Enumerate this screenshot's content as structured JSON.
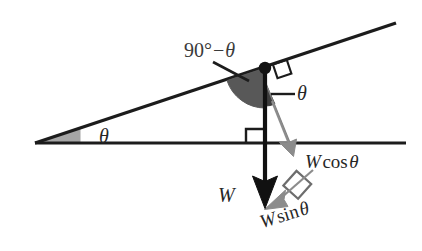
{
  "figure": {
    "kind": "physics-free-body-diagram",
    "colors": {
      "line": "#1c1c1c",
      "wedge_incline_fill": "#a6a6a6",
      "wedge_apex_fill": "#585858",
      "wedge_small_fill": "#4a4a4a",
      "component_arrow": "#8c8c8c",
      "weight_arrow": "#111111",
      "background": "#ffffff",
      "text": "#262626"
    }
  },
  "labels": {
    "angle_complement": {
      "prefix": "90",
      "degree": "°",
      "minus": "−",
      "theta": "θ",
      "full": "90° − θ"
    },
    "theta_incline": "θ",
    "theta_apex": "θ",
    "weight": "W",
    "weight_cos": {
      "magnitude": "W",
      "function": "cos",
      "angle": "θ",
      "full": "W cos θ"
    },
    "weight_sin": {
      "magnitude": "W",
      "function": "sin",
      "angle": "θ",
      "full": "W sin θ"
    }
  },
  "geometry": {
    "ground_line": {
      "x1": 35,
      "y1": 143,
      "x2": 406,
      "y2": 143
    },
    "incline_line": {
      "x1": 35,
      "y1": 143,
      "x2": 396,
      "y2": 23
    },
    "incline_angle_deg": 18,
    "apex_point": {
      "x": 265,
      "y": 68
    },
    "weight_vector": {
      "x1": 265,
      "y1": 68,
      "x2": 265,
      "y2": 207
    },
    "cos_vector": {
      "x1": 265,
      "y1": 82,
      "x2": 295,
      "y2": 155
    },
    "sin_vector": {
      "x1": 310,
      "y1": 168,
      "x2": 266,
      "y2": 208
    },
    "right_angle_markers": [
      {
        "name": "apex-perpendicular",
        "x": 283,
        "y": 70
      },
      {
        "name": "ground-vertical",
        "x": 246,
        "y": 129
      },
      {
        "name": "components",
        "x": 289,
        "y": 181
      }
    ]
  }
}
